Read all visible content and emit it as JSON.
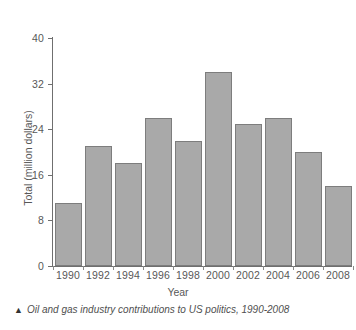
{
  "figure": {
    "caption_marker": "▲",
    "caption": "Oil and gas industry contributions to US politics, 1990-2008",
    "axis_title_x": "Year",
    "axis_title_y": "Total (million dollars)"
  },
  "chart_data": {
    "type": "bar",
    "title": "",
    "subtitle": "",
    "xlabel": "Year",
    "ylabel": "Total (million dollars)",
    "categories": [
      "1990",
      "1992",
      "1994",
      "1996",
      "1998",
      "2000",
      "2002",
      "2004",
      "2006",
      "2008"
    ],
    "values": [
      11.0,
      21.0,
      18.0,
      26.0,
      22.0,
      34.0,
      25.0,
      26.0,
      20.0,
      14.0
    ],
    "ylim": [
      0,
      40
    ],
    "yticks": [
      0,
      8,
      16,
      24,
      32,
      40
    ],
    "ytick_labels": [
      "0",
      "8",
      "16",
      "24",
      "32",
      "40"
    ],
    "xtick_labels": [
      "1990",
      "1992",
      "1994",
      "1996",
      "1998",
      "2000",
      "2002",
      "2004",
      "2006",
      "2008"
    ],
    "grid": false,
    "legend": "none",
    "bar_color": "#a9a9a9",
    "bar_edge_color": "#7d7d7d",
    "axis_color": "#6f6f6f",
    "text_color": "#585858",
    "background": "#ffffff"
  }
}
